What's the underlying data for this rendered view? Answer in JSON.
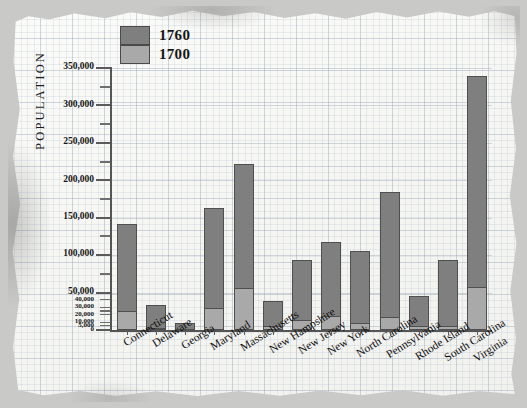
{
  "chart_data": {
    "type": "bar",
    "title": "",
    "xlabel": "",
    "ylabel": "POPULATION",
    "ylim": [
      0,
      350000
    ],
    "grid": true,
    "legend_position": "top-left",
    "y_major_ticks": [
      0,
      50000,
      100000,
      150000,
      200000,
      250000,
      300000,
      350000
    ],
    "y_minor_ticks": [
      25000,
      75000,
      125000,
      175000,
      225000,
      275000,
      325000
    ],
    "y_tick_labels": [
      "0",
      "5,000",
      "10,000",
      "20,000",
      "30,000",
      "40,000",
      "50,000",
      "100,000",
      "150,000",
      "200,000",
      "250,000",
      "300,000",
      "350,000"
    ],
    "y_dense_ticks": [
      5000,
      10000,
      20000,
      30000,
      40000
    ],
    "categories": [
      "Connecticut",
      "Delaware",
      "Georgia",
      "Maryland",
      "Massachusetts",
      "New Hampshire",
      "New Jersey",
      "New York",
      "North Carolina",
      "Pennsylvania",
      "Rhode Island",
      "South Carolina",
      "Virginia"
    ],
    "series": [
      {
        "name": "1760",
        "color": "#7f7f7f",
        "values": [
          142000,
          33000,
          9000,
          163000,
          222000,
          39000,
          93000,
          118000,
          105000,
          184000,
          45000,
          94000,
          340000
        ]
      },
      {
        "name": "1700",
        "color": "#a9a9a9",
        "values": [
          26000,
          2500,
          0,
          29000,
          56000,
          5000,
          14000,
          19000,
          10000,
          18000,
          5000,
          5700,
          58000
        ]
      }
    ]
  },
  "legend": {
    "items": [
      {
        "label": "1760",
        "color": "#7f7f7f"
      },
      {
        "label": "1700",
        "color": "#a9a9a9"
      }
    ]
  },
  "axis": {
    "y_title": "POPULATION"
  }
}
